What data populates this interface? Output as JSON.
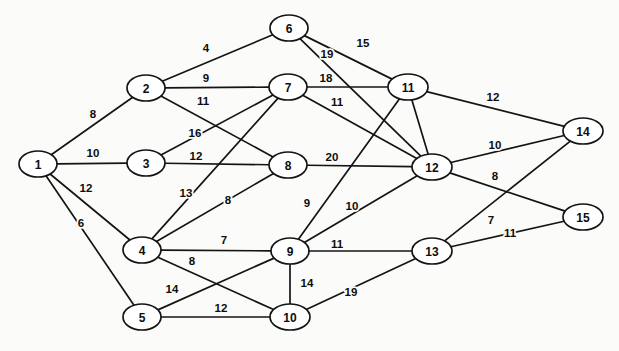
{
  "diagram": {
    "type": "node-link-graph",
    "width": 619,
    "height": 351,
    "background_color": "#fbfbfa",
    "stroke_color": "#141414",
    "node_fill_color": "#ffffff",
    "text_color": "#0d0d0d"
  },
  "nodes": [
    {
      "id": "1",
      "label": "1",
      "x": 38,
      "y": 164,
      "rx": 19,
      "ry": 13
    },
    {
      "id": "2",
      "label": "2",
      "x": 146,
      "y": 88,
      "rx": 19,
      "ry": 13
    },
    {
      "id": "3",
      "label": "3",
      "x": 146,
      "y": 163,
      "rx": 19,
      "ry": 13
    },
    {
      "id": "4",
      "label": "4",
      "x": 142,
      "y": 250,
      "rx": 19,
      "ry": 13
    },
    {
      "id": "5",
      "label": "5",
      "x": 142,
      "y": 317,
      "rx": 19,
      "ry": 13
    },
    {
      "id": "6",
      "label": "6",
      "x": 289,
      "y": 28,
      "rx": 19,
      "ry": 13
    },
    {
      "id": "7",
      "label": "7",
      "x": 288,
      "y": 87,
      "rx": 19,
      "ry": 13
    },
    {
      "id": "8",
      "label": "8",
      "x": 288,
      "y": 165,
      "rx": 19,
      "ry": 13
    },
    {
      "id": "9",
      "label": "9",
      "x": 290,
      "y": 251,
      "rx": 19,
      "ry": 13
    },
    {
      "id": "10",
      "label": "10",
      "x": 290,
      "y": 317,
      "rx": 20,
      "ry": 13
    },
    {
      "id": "11",
      "label": "11",
      "x": 408,
      "y": 87,
      "rx": 20,
      "ry": 13
    },
    {
      "id": "12",
      "label": "12",
      "x": 432,
      "y": 167,
      "rx": 20,
      "ry": 13
    },
    {
      "id": "13",
      "label": "13",
      "x": 432,
      "y": 251,
      "rx": 20,
      "ry": 13
    },
    {
      "id": "14",
      "label": "14",
      "x": 583,
      "y": 131,
      "rx": 20,
      "ry": 13
    },
    {
      "id": "15",
      "label": "15",
      "x": 583,
      "y": 217,
      "rx": 20,
      "ry": 13
    }
  ],
  "edges": [
    {
      "from": "1",
      "to": "2",
      "weight": "8",
      "lx": 93,
      "ly": 114
    },
    {
      "from": "1",
      "to": "3",
      "weight": "10",
      "lx": 93,
      "ly": 153
    },
    {
      "from": "1",
      "to": "4",
      "weight": "12",
      "lx": 86,
      "ly": 188
    },
    {
      "from": "1",
      "to": "5",
      "weight": "6",
      "lx": 81,
      "ly": 223
    },
    {
      "from": "2",
      "to": "6",
      "weight": "4",
      "lx": 206,
      "ly": 48
    },
    {
      "from": "2",
      "to": "7",
      "weight": "9",
      "lx": 206,
      "ly": 78
    },
    {
      "from": "2",
      "to": "8",
      "weight": "11",
      "lx": 203,
      "ly": 101
    },
    {
      "from": "3",
      "to": "7",
      "weight": "16",
      "lx": 195,
      "ly": 133
    },
    {
      "from": "3",
      "to": "8",
      "weight": "12",
      "lx": 196,
      "ly": 156
    },
    {
      "from": "4",
      "to": "7",
      "weight": "13",
      "lx": 186,
      "ly": 193
    },
    {
      "from": "4",
      "to": "8",
      "weight": "8",
      "lx": 228,
      "ly": 200
    },
    {
      "from": "4",
      "to": "9",
      "weight": "7",
      "lx": 224,
      "ly": 240
    },
    {
      "from": "4",
      "to": "10",
      "weight": "8",
      "lx": 192,
      "ly": 261
    },
    {
      "from": "5",
      "to": "9",
      "weight": "14",
      "lx": 172,
      "ly": 289
    },
    {
      "from": "5",
      "to": "10",
      "weight": "12",
      "lx": 221,
      "ly": 308
    },
    {
      "from": "6",
      "to": "11",
      "weight": "15",
      "lx": 363,
      "ly": 43
    },
    {
      "from": "6",
      "to": "12",
      "weight": "19",
      "lx": 327,
      "ly": 54
    },
    {
      "from": "7",
      "to": "11",
      "weight": "18",
      "lx": 326,
      "ly": 78
    },
    {
      "from": "7",
      "to": "12",
      "weight": "11",
      "lx": 337,
      "ly": 102
    },
    {
      "from": "8",
      "to": "12",
      "weight": "20",
      "lx": 332,
      "ly": 157
    },
    {
      "from": "9",
      "to": "11",
      "weight": "9",
      "lx": 307,
      "ly": 203
    },
    {
      "from": "9",
      "to": "12",
      "weight": "10",
      "lx": 352,
      "ly": 206
    },
    {
      "from": "9",
      "to": "13",
      "weight": "11",
      "lx": 337,
      "ly": 244
    },
    {
      "from": "9",
      "to": "10",
      "weight": "14",
      "lx": 307,
      "ly": 283
    },
    {
      "from": "10",
      "to": "13",
      "weight": "19",
      "lx": 351,
      "ly": 292
    },
    {
      "from": "11",
      "to": "12",
      "weight": "",
      "lx": 0,
      "ly": 0
    },
    {
      "from": "11",
      "to": "14",
      "weight": "12",
      "lx": 493,
      "ly": 97
    },
    {
      "from": "12",
      "to": "14",
      "weight": "10",
      "lx": 495,
      "ly": 145
    },
    {
      "from": "12",
      "to": "15",
      "weight": "8",
      "lx": 495,
      "ly": 176
    },
    {
      "from": "13",
      "to": "14",
      "weight": "7",
      "lx": 491,
      "ly": 220
    },
    {
      "from": "13",
      "to": "15",
      "weight": "11",
      "lx": 510,
      "ly": 233
    }
  ]
}
